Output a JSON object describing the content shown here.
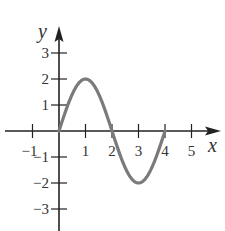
{
  "chart_data": {
    "type": "line",
    "title": "",
    "xlabel": "x",
    "ylabel": "y",
    "xlim": [
      -1.5,
      6
    ],
    "ylim": [
      -3.8,
      3.9
    ],
    "x_ticks": [
      -1,
      1,
      2,
      3,
      4,
      5
    ],
    "x_tick_labels": [
      "−1",
      "1",
      "2",
      "3",
      "4",
      "5"
    ],
    "y_ticks": [
      3,
      2,
      1,
      -1,
      -2,
      -3
    ],
    "y_tick_labels": [
      "3",
      "2",
      "1",
      "−1",
      "−2",
      "−3"
    ],
    "grid": false,
    "legend": null,
    "series": [
      {
        "name": "y = 2 sin(πx/2)",
        "color": "#7a7a7a",
        "x": [
          0,
          0.5,
          1,
          1.5,
          2,
          2.5,
          3,
          3.5,
          4
        ],
        "y": [
          0,
          1.41,
          2,
          1.41,
          0,
          -1.41,
          -2,
          -1.41,
          0
        ]
      }
    ]
  },
  "colors": {
    "axis": "#222222",
    "curve": "#7a7a7a",
    "text": "#333333"
  }
}
